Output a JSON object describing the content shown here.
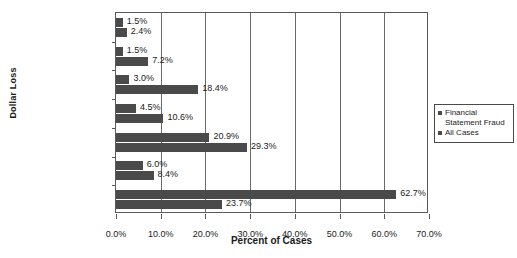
{
  "chart_data": {
    "type": "bar",
    "orientation": "horizontal",
    "title": "",
    "xlabel": "Percent of Cases",
    "ylabel": "Dollar Loss",
    "categories": [
      "$1–$999",
      "$1,000–$9,999",
      "$10,000–$49,999",
      "$50,000–$99,999",
      "$100,000–$499,999",
      "$500,000–$999,999",
      "$1,000,000 and up"
    ],
    "series": [
      {
        "name": "Financial Statement Fraud",
        "values": [
          1.5,
          1.5,
          3.0,
          4.5,
          20.9,
          6.0,
          62.7
        ],
        "labels": [
          "1.5%",
          "1.5%",
          "3.0%",
          "4.5%",
          "20.9%",
          "6.0%",
          "62.7%"
        ],
        "color": "#4a4a4a"
      },
      {
        "name": "All Cases",
        "values": [
          2.4,
          7.2,
          18.4,
          10.6,
          29.3,
          8.4,
          23.7
        ],
        "labels": [
          "2.4%",
          "7.2%",
          "18.4%",
          "10.6%",
          "29.3%",
          "8.4%",
          "23.7%"
        ],
        "color": "#4a4a4a"
      }
    ],
    "xlim": [
      0,
      70
    ],
    "xticks": [
      0,
      10,
      20,
      30,
      40,
      50,
      60,
      70
    ],
    "xtick_labels": [
      "0.0%",
      "10.0%",
      "20.0%",
      "30.0%",
      "40.0%",
      "50.0%",
      "60.0%",
      "70.0%"
    ],
    "grid": "vertical",
    "legend_position": "right"
  },
  "legend": {
    "items": [
      {
        "label": "Financial Statement Fraud"
      },
      {
        "label": "All Cases"
      }
    ]
  },
  "axes": {
    "y_title": "Dollar Loss",
    "x_title": "Percent of Cases"
  }
}
